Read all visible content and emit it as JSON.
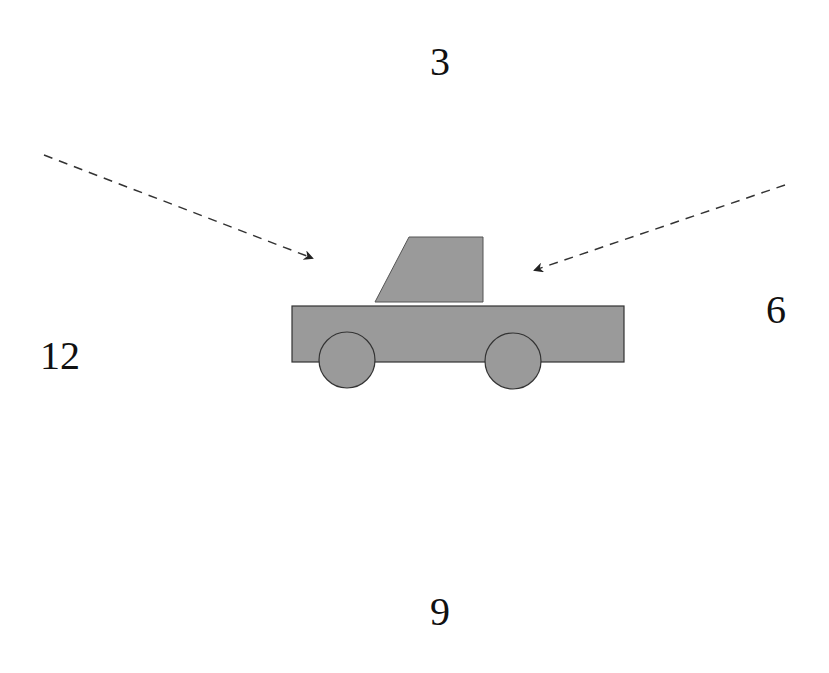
{
  "labels": {
    "top": "3",
    "right": "6",
    "bottom": "9",
    "left": "12"
  },
  "colors": {
    "car_fill": "#9a9a9a",
    "car_stroke": "#333333",
    "arrow": "#222222"
  },
  "diagram": {
    "arrows": [
      {
        "from": "upper-left",
        "to": "cab-left"
      },
      {
        "from": "upper-right",
        "to": "cab-right"
      }
    ]
  }
}
